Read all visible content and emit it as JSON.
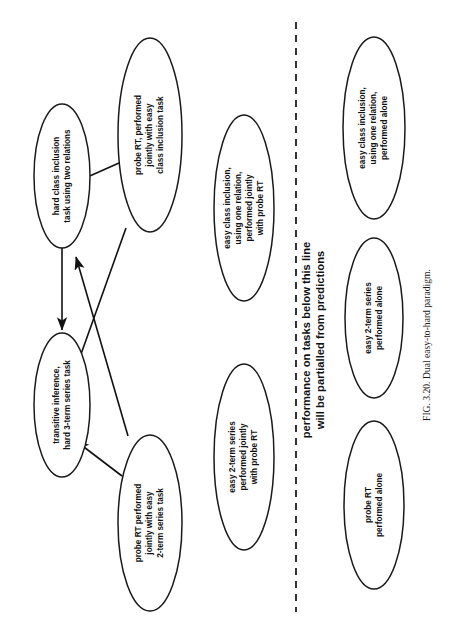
{
  "figure": {
    "caption": "FIG. 3.20.   Dual easy-to-hard paradigm.",
    "divider_note_line1": "performance on tasks below this line",
    "divider_note_line2": "will be partialled from predictions",
    "stroke_color": "#111111",
    "fill_color": "#ffffff",
    "background": "#ffffff"
  },
  "nodes": {
    "hard_class_inclusion": {
      "line1": "hard class inclusion",
      "line2": "task using two relations"
    },
    "transitive_inference": {
      "line1": "transitive inference,",
      "line2": "hard 3-term series task"
    },
    "probe_rt_with_class_inclusion": {
      "line1": "probe RT, performed",
      "line2": "jointly with easy",
      "line3": "class inclusion task"
    },
    "probe_rt_with_2term_series": {
      "line1": "probe RT performed",
      "line2": "jointly with easy",
      "line3": "2-term series task"
    },
    "easy_class_inclusion_joint": {
      "line1": "easy class inclusion,",
      "line2": "using one relation,",
      "line3": "performed jointly",
      "line4": "with probe RT"
    },
    "easy_2term_series_joint": {
      "line1": "easy 2-term series",
      "line2": "performed  jointly",
      "line3": "with probe RT"
    },
    "easy_class_inclusion_alone": {
      "line1": "easy class inclusion,",
      "line2": "using one relation,",
      "line3": "performed alone"
    },
    "easy_2term_series_alone": {
      "line1": "easy 2-term series",
      "line2": "performed alone"
    },
    "probe_rt_alone": {
      "line1": "probe RT",
      "line2": "performed alone"
    }
  }
}
